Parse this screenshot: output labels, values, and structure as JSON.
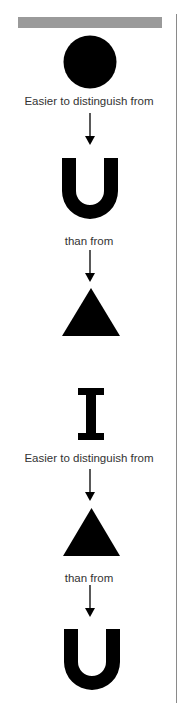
{
  "header": {
    "bar_color": "#9a9a9a"
  },
  "groups": [
    {
      "top_shape": "circle",
      "label_1": "Easier to distinguish from",
      "middle_shape": "U",
      "label_2": "than from",
      "bottom_shape": "triangle"
    },
    {
      "top_shape": "I",
      "label_1": "Easier to distinguish from",
      "middle_shape": "triangle",
      "label_2": "than from",
      "bottom_shape": "U"
    }
  ]
}
